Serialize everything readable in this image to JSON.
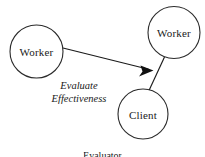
{
  "diagram": {
    "background_color": "#ffffff",
    "stroke_color": "#1a1a1a",
    "nodes": [
      {
        "id": "worker-left",
        "label": "Worker",
        "cx": 36.5,
        "cy": 51.5,
        "r": 26.5
      },
      {
        "id": "worker-right",
        "label": "Worker",
        "cx": 174,
        "cy": 32.5,
        "r": 26
      },
      {
        "id": "client",
        "label": "Client",
        "cx": 143,
        "cy": 114,
        "r": 25
      }
    ],
    "edges": [
      {
        "id": "evaluate-arrow",
        "from": "worker-left",
        "to": "worker-right",
        "arrow": true,
        "x1": 63,
        "y1": 48,
        "x2": 152,
        "y2": 70
      },
      {
        "id": "worker-client-link",
        "from": "worker-right",
        "to": "client",
        "arrow": false,
        "x1": 164,
        "y1": 57,
        "x2": 149,
        "y2": 90
      }
    ],
    "edge_caption": {
      "line1": "Evaluate",
      "line2": "Effectiveness",
      "x": 79,
      "y": 80
    },
    "bottom_caption": "Evaluator"
  }
}
